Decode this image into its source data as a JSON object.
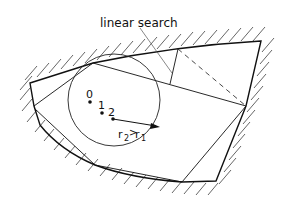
{
  "diagram": {
    "labels": {
      "linear_search": "linear search",
      "point_0": "0",
      "point_1": "1",
      "point_2": "2",
      "radius_relation_r2": "r",
      "radius_relation_sub2": "2",
      "radius_relation_gt": ">",
      "radius_relation_r1": "r",
      "radius_relation_sub1": "1"
    },
    "colors": {
      "stroke": "#111111",
      "hatch": "#555555",
      "background": "#ffffff"
    }
  }
}
